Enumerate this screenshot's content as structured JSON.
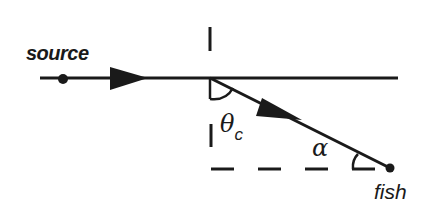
{
  "diagram": {
    "labels": {
      "source": "source",
      "fish": "fish",
      "theta": "θ",
      "theta_subscript": "c",
      "alpha": "α"
    },
    "elements": {
      "surface_line": "horizontal water surface",
      "normal_line": "dashed vertical normal",
      "reference_line": "dashed horizontal line at fish depth",
      "incident_ray": "ray from source to refraction point",
      "refracted_ray": "ray from refraction point to fish"
    },
    "colors": {
      "ink": "#1a1a1a",
      "background": "#ffffff"
    }
  }
}
